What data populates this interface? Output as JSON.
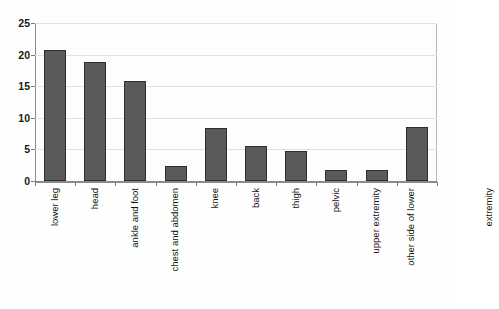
{
  "chart_data": {
    "type": "bar",
    "title": "",
    "subtitle": "",
    "xlabel": "",
    "ylabel": "",
    "ylim": [
      0,
      25
    ],
    "yticks": [
      0,
      5,
      10,
      15,
      20,
      25
    ],
    "grid": true,
    "legend": false,
    "orientation": "vertical",
    "bar_color": "#5a5a5a",
    "bar_edge_color": "#2e2e2e",
    "gridline_color": "#e2e2e2",
    "axis_color": "#8a8a8a",
    "background_color": "#fdfdfd",
    "categories": [
      "lower leg",
      "head",
      "ankle and foot",
      "chest and abdomen",
      "knee",
      "back",
      "thigh",
      "pelvic",
      "upper extremity",
      "other side of lower extremity"
    ],
    "category_lines": [
      [
        "lower leg"
      ],
      [
        "head"
      ],
      [
        "ankle and foot"
      ],
      [
        "chest and abdomen"
      ],
      [
        "knee"
      ],
      [
        "back"
      ],
      [
        "thigh"
      ],
      [
        "pelvic"
      ],
      [
        "upper extremity"
      ],
      [
        "other side of lower",
        "extremity"
      ]
    ],
    "values": [
      20.7,
      18.9,
      15.9,
      2.4,
      8.4,
      5.5,
      4.8,
      1.8,
      1.8,
      8.6
    ]
  }
}
